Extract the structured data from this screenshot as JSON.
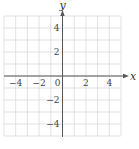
{
  "chart_data": {
    "type": "line",
    "title": "",
    "xlabel": "x",
    "ylabel": "y",
    "xlim": [
      -5,
      5
    ],
    "ylim": [
      -5,
      5
    ],
    "grid": true,
    "x_ticks": [
      -4,
      -2,
      0,
      2,
      4
    ],
    "y_ticks": [
      4,
      2,
      -2,
      -4
    ],
    "x_tick_labels": [
      "−4",
      "−2",
      "0",
      "2",
      "4"
    ],
    "y_tick_labels": [
      "4",
      "2",
      "−2",
      "−4"
    ],
    "series": [],
    "legend": null
  },
  "colors": {
    "grid": "#d9d9d9",
    "axis": "#555555",
    "text": "#444444"
  }
}
